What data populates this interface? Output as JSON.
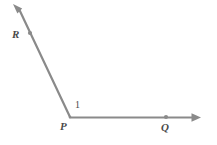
{
  "figure": {
    "type": "geometry-diagram",
    "background_color": "#ffffff",
    "stroke_color": "#8a8a8a",
    "label_color": "#4a4a4a",
    "width": 217,
    "height": 145
  },
  "labels": {
    "vertex": "P",
    "ray_up_point": "R",
    "ray_right_point": "Q",
    "angle": "1"
  },
  "points": {
    "P": {
      "x": 70,
      "y": 117
    },
    "R": {
      "x": 30,
      "y": 33
    },
    "Q": {
      "x": 166,
      "y": 117
    },
    "ray_PR_tip": {
      "x": 13,
      "y": 4
    },
    "ray_PQ_tip": {
      "x": 201,
      "y": 117
    }
  },
  "geometry": {
    "rays": [
      {
        "name": "ray-PR",
        "from": "P",
        "through": "R",
        "arrow": true
      },
      {
        "name": "ray-PQ",
        "from": "P",
        "through": "Q",
        "arrow": true
      }
    ],
    "dots": [
      {
        "name": "point-R-dot",
        "x": 30,
        "y": 33
      },
      {
        "name": "point-Q-dot",
        "x": 166,
        "y": 117
      }
    ]
  }
}
